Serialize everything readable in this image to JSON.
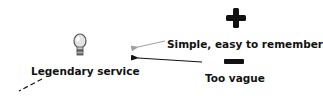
{
  "central_node": {
    "label": "Legendary service",
    "icon": "lightbulb-icon"
  },
  "branches": [
    {
      "sign": "plus",
      "icon": "plus-icon",
      "label": "Simple, easy to remember",
      "connector_color": "#a0a0a0"
    },
    {
      "sign": "minus",
      "icon": "minus-icon",
      "label": "Too vague",
      "connector_color": "#111111"
    }
  ],
  "colors": {
    "text": "#111111",
    "background": "#ffffff"
  }
}
